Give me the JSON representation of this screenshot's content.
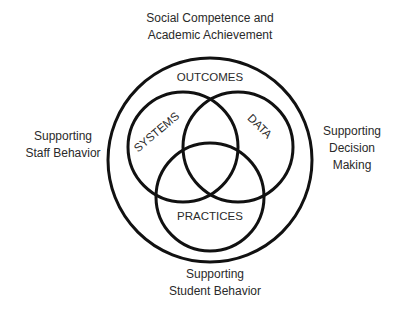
{
  "diagram": {
    "type": "venn",
    "outer_labels": {
      "top": [
        "Social Competence and",
        "Academic Achievement"
      ],
      "left": [
        "Supporting",
        "Staff Behavior"
      ],
      "right": [
        "Supporting",
        "Decision",
        "Making"
      ],
      "bottom": [
        "Supporting",
        "Student Behavior"
      ]
    },
    "outer_circle": {
      "label": "OUTCOMES",
      "cx": 210,
      "cy": 160,
      "r": 102
    },
    "circles": [
      {
        "label": "SYSTEMS",
        "cx": 183,
        "cy": 147,
        "r": 55
      },
      {
        "label": "DATA",
        "cx": 238,
        "cy": 147,
        "r": 55
      },
      {
        "label": "PRACTICES",
        "cx": 210,
        "cy": 197,
        "r": 54
      }
    ],
    "stroke_color": "#111111"
  }
}
